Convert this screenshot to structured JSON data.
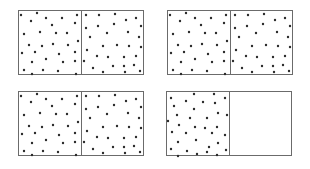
{
  "figure": {
    "colors": {
      "border": "#6b6b6b",
      "dot": "#2a2a2a",
      "background": "#ffffff"
    },
    "panels": [
      {
        "id": "top-left",
        "x": 18,
        "y": 10,
        "left_half": "patternA",
        "right_half": "patternB"
      },
      {
        "id": "top-right",
        "x": 167,
        "y": 10,
        "left_half": "patternA",
        "right_half": "patternB"
      },
      {
        "id": "bottom-left",
        "x": 18,
        "y": 91,
        "left_half": "patternA",
        "right_half": "patternB"
      },
      {
        "id": "bottom-right",
        "x": 166,
        "y": 91,
        "left_half": "patternC",
        "right_half": "empty"
      }
    ],
    "patterns": {
      "patternA": [
        [
          2,
          4
        ],
        [
          18,
          2
        ],
        [
          12,
          10
        ],
        [
          27,
          7
        ],
        [
          43,
          7
        ],
        [
          58,
          4
        ],
        [
          33,
          14
        ],
        [
          56,
          12
        ],
        [
          5,
          23
        ],
        [
          21,
          21
        ],
        [
          37,
          22
        ],
        [
          48,
          22
        ],
        [
          59,
          30
        ],
        [
          10,
          34
        ],
        [
          23,
          35
        ],
        [
          34,
          33
        ],
        [
          49,
          34
        ],
        [
          3,
          42
        ],
        [
          16,
          41
        ],
        [
          40,
          43
        ],
        [
          56,
          41
        ],
        [
          27,
          48
        ],
        [
          13,
          51
        ],
        [
          44,
          51
        ],
        [
          56,
          50
        ],
        [
          5,
          59
        ],
        [
          24,
          59
        ],
        [
          39,
          60
        ],
        [
          57,
          63
        ],
        [
          13,
          63
        ]
      ],
      "patternB": [
        [
          4,
          4
        ],
        [
          17,
          4
        ],
        [
          33,
          3
        ],
        [
          54,
          7
        ],
        [
          4,
          17
        ],
        [
          16,
          15
        ],
        [
          32,
          13
        ],
        [
          44,
          9
        ],
        [
          59,
          15
        ],
        [
          8,
          26
        ],
        [
          25,
          22
        ],
        [
          46,
          21
        ],
        [
          57,
          26
        ],
        [
          21,
          35
        ],
        [
          35,
          34
        ],
        [
          47,
          35
        ],
        [
          59,
          36
        ],
        [
          5,
          39
        ],
        [
          15,
          45
        ],
        [
          26,
          46
        ],
        [
          42,
          46
        ],
        [
          54,
          45
        ],
        [
          2,
          50
        ],
        [
          31,
          55
        ],
        [
          42,
          55
        ],
        [
          52,
          54
        ],
        [
          11,
          57
        ],
        [
          21,
          61
        ],
        [
          43,
          61
        ],
        [
          58,
          60
        ]
      ],
      "patternC": [
        [
          4,
          6
        ],
        [
          27,
          2
        ],
        [
          47,
          2
        ],
        [
          58,
          6
        ],
        [
          19,
          9
        ],
        [
          36,
          10
        ],
        [
          48,
          11
        ],
        [
          7,
          14
        ],
        [
          27,
          17
        ],
        [
          51,
          21
        ],
        [
          10,
          23
        ],
        [
          60,
          23
        ],
        [
          23,
          26
        ],
        [
          40,
          26
        ],
        [
          1,
          29
        ],
        [
          12,
          33
        ],
        [
          28,
          35
        ],
        [
          38,
          36
        ],
        [
          50,
          35
        ],
        [
          5,
          40
        ],
        [
          19,
          41
        ],
        [
          45,
          41
        ],
        [
          58,
          43
        ],
        [
          29,
          48
        ],
        [
          11,
          50
        ],
        [
          51,
          51
        ],
        [
          42,
          55
        ],
        [
          4,
          57
        ],
        [
          20,
          59
        ],
        [
          40,
          60
        ],
        [
          59,
          58
        ],
        [
          30,
          62
        ],
        [
          50,
          63
        ],
        [
          11,
          64
        ]
      ],
      "empty": []
    }
  }
}
